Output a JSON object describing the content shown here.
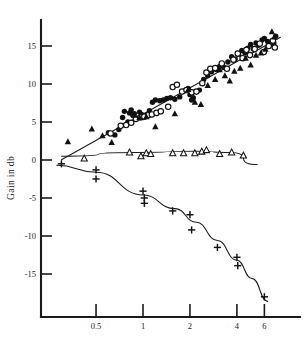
{
  "chart_data": {
    "type": "scatter",
    "title": "",
    "subtitle": "",
    "xlabel": "",
    "ylabel": "Gain in db",
    "xscale": "log",
    "yscale": "linear",
    "grid": false,
    "legend_position": "none",
    "xlim": [
      0.22,
      8.2
    ],
    "ylim": [
      -18.5,
      17.5
    ],
    "xticks": [
      0.5,
      1,
      2,
      4,
      6
    ],
    "xtick_labels": [
      "0.5",
      "1",
      "2",
      "4",
      "6"
    ],
    "yticks": [
      15,
      10,
      5,
      0,
      -5,
      -10,
      -15
    ],
    "ytick_labels": [
      "15",
      "10",
      "5",
      "0",
      "-5",
      "-10",
      "-15"
    ],
    "annotations": [],
    "series": [
      {
        "name": "filled-circle-series",
        "marker": "filled-circle",
        "points": [
          [
            0.6,
            3.6
          ],
          [
            0.62,
            3.5
          ],
          [
            0.66,
            3.3
          ],
          [
            0.7,
            4.0
          ],
          [
            0.74,
            5.6
          ],
          [
            0.76,
            6.4
          ],
          [
            0.78,
            4.6
          ],
          [
            0.8,
            5.0
          ],
          [
            0.82,
            6.2
          ],
          [
            0.84,
            6.6
          ],
          [
            0.86,
            5.9
          ],
          [
            0.88,
            6.1
          ],
          [
            0.9,
            5.5
          ],
          [
            0.95,
            6.3
          ],
          [
            0.98,
            6.0
          ],
          [
            1.0,
            5.6
          ],
          [
            1.05,
            5.9
          ],
          [
            1.1,
            6.5
          ],
          [
            1.15,
            7.6
          ],
          [
            1.2,
            7.9
          ],
          [
            1.28,
            7.8
          ],
          [
            1.35,
            7.9
          ],
          [
            1.42,
            8.1
          ],
          [
            1.5,
            8.2
          ],
          [
            1.6,
            8.0
          ],
          [
            1.72,
            8.3
          ],
          [
            1.85,
            9.1
          ],
          [
            1.95,
            9.4
          ],
          [
            2.0,
            8.6
          ],
          [
            2.05,
            7.9
          ],
          [
            2.1,
            8.2
          ],
          [
            2.3,
            9.2
          ],
          [
            2.45,
            10.6
          ],
          [
            2.6,
            11.1
          ],
          [
            2.75,
            11.6
          ],
          [
            2.95,
            11.9
          ],
          [
            3.1,
            12.3
          ],
          [
            3.3,
            12.2
          ],
          [
            3.5,
            12.9
          ],
          [
            3.7,
            13.6
          ],
          [
            3.9,
            13.3
          ],
          [
            4.1,
            13.9
          ],
          [
            4.3,
            14.4
          ],
          [
            4.5,
            14.1
          ],
          [
            4.7,
            14.7
          ],
          [
            4.9,
            15.2
          ],
          [
            5.1,
            14.6
          ],
          [
            5.3,
            15.4
          ],
          [
            5.5,
            15.1
          ],
          [
            5.8,
            15.8
          ],
          [
            6.0,
            16.0
          ],
          [
            6.3,
            15.6
          ],
          [
            6.6,
            15.2
          ],
          [
            6.9,
            15.4
          ],
          [
            7.1,
            16.3
          ]
        ]
      },
      {
        "name": "open-circle-series",
        "marker": "open-circle",
        "points": [
          [
            0.62,
            3.5
          ],
          [
            0.72,
            4.5
          ],
          [
            0.78,
            4.6
          ],
          [
            0.84,
            4.9
          ],
          [
            0.9,
            5.4
          ],
          [
            0.96,
            5.6
          ],
          [
            1.02,
            5.7
          ],
          [
            1.08,
            5.9
          ],
          [
            1.14,
            6.0
          ],
          [
            1.22,
            6.2
          ],
          [
            1.3,
            6.4
          ],
          [
            1.45,
            7.0
          ],
          [
            1.55,
            9.6
          ],
          [
            1.65,
            9.9
          ],
          [
            1.78,
            9.0
          ],
          [
            1.9,
            9.2
          ],
          [
            2.05,
            8.9
          ],
          [
            2.2,
            9.0
          ],
          [
            2.4,
            10.1
          ],
          [
            2.55,
            11.5
          ],
          [
            2.7,
            12.0
          ],
          [
            2.9,
            12.1
          ],
          [
            3.2,
            12.7
          ],
          [
            3.45,
            12.0
          ],
          [
            3.8,
            13.2
          ],
          [
            4.05,
            14.0
          ],
          [
            4.35,
            13.4
          ],
          [
            4.6,
            14.5
          ],
          [
            4.85,
            13.8
          ],
          [
            5.2,
            14.6
          ],
          [
            5.6,
            15.3
          ],
          [
            5.95,
            14.2
          ],
          [
            6.4,
            15.0
          ],
          [
            6.8,
            15.7
          ],
          [
            7.0,
            14.8
          ]
        ]
      },
      {
        "name": "filled-triangle-series",
        "marker": "filled-triangle",
        "points": [
          [
            0.33,
            2.4
          ],
          [
            0.47,
            4.1
          ],
          [
            0.55,
            3.2
          ],
          [
            0.63,
            2.3
          ],
          [
            0.88,
            5.9
          ],
          [
            0.95,
            5.6
          ],
          [
            1.05,
            5.7
          ],
          [
            1.2,
            4.4
          ],
          [
            1.6,
            6.1
          ],
          [
            1.95,
            9.3
          ],
          [
            2.15,
            7.6
          ],
          [
            2.35,
            7.3
          ],
          [
            2.6,
            9.8
          ],
          [
            2.9,
            10.6
          ],
          [
            3.1,
            11.9
          ],
          [
            3.35,
            11.1
          ],
          [
            3.6,
            10.4
          ],
          [
            3.85,
            11.7
          ],
          [
            4.2,
            12.1
          ],
          [
            4.55,
            13.4
          ],
          [
            4.9,
            12.5
          ],
          [
            5.3,
            13.8
          ],
          [
            5.7,
            14.1
          ],
          [
            6.1,
            14.6
          ],
          [
            6.7,
            16.9
          ],
          [
            6.95,
            16.2
          ]
        ]
      },
      {
        "name": "open-triangle-series",
        "marker": "open-triangle",
        "points": [
          [
            0.42,
            0.2
          ],
          [
            0.82,
            1.0
          ],
          [
            0.97,
            0.5
          ],
          [
            1.05,
            0.9
          ],
          [
            1.12,
            0.8
          ],
          [
            1.55,
            0.9
          ],
          [
            1.82,
            0.9
          ],
          [
            2.15,
            0.9
          ],
          [
            2.38,
            1.1
          ],
          [
            2.55,
            1.3
          ],
          [
            3.1,
            0.8
          ],
          [
            3.7,
            1.0
          ],
          [
            4.4,
            0.6
          ]
        ]
      },
      {
        "name": "plus-series",
        "marker": "plus",
        "points": [
          [
            0.3,
            -0.5
          ],
          [
            0.5,
            -1.3
          ],
          [
            0.5,
            -2.5
          ],
          [
            1.0,
            -4.1
          ],
          [
            1.02,
            -5.0
          ],
          [
            1.02,
            -5.7
          ],
          [
            1.55,
            -6.7
          ],
          [
            2.0,
            -7.2
          ],
          [
            2.05,
            -9.2
          ],
          [
            3.0,
            -11.5
          ],
          [
            4.0,
            -12.8
          ],
          [
            4.05,
            -13.9
          ],
          [
            6.0,
            -18.0
          ]
        ]
      }
    ],
    "fit_curves": [
      {
        "name": "upper-trend-line",
        "kind": "line"
      },
      {
        "name": "middle-flat-curve",
        "kind": "curve"
      },
      {
        "name": "lower-descending-curve",
        "kind": "curve"
      }
    ]
  }
}
